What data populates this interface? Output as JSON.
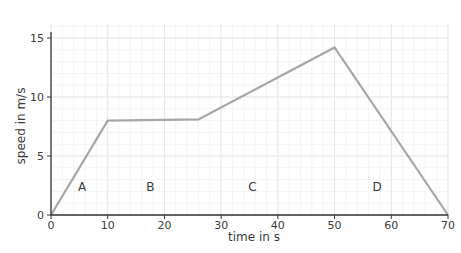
{
  "chart_data": {
    "type": "line",
    "title": "",
    "xlabel": "time in s",
    "ylabel": "speed in m/s",
    "xlim": [
      0,
      70
    ],
    "ylim": [
      0,
      15
    ],
    "xticks": [
      0,
      10,
      20,
      30,
      40,
      50,
      60,
      70
    ],
    "yticks": [
      0,
      5,
      10,
      15
    ],
    "grid": true,
    "legend": null,
    "series": [
      {
        "name": "speed",
        "x": [
          0,
          10,
          26,
          50,
          70
        ],
        "y": [
          0,
          8,
          8.1,
          14.2,
          0
        ],
        "color": "#a6a6a6"
      }
    ],
    "annotations": [
      {
        "text": "A",
        "x": 5.5,
        "y": 2.4
      },
      {
        "text": "B",
        "x": 17.5,
        "y": 2.4
      },
      {
        "text": "C",
        "x": 35.5,
        "y": 2.4
      },
      {
        "text": "D",
        "x": 57.5,
        "y": 2.4
      }
    ]
  },
  "colors": {
    "line": "#a6a6a6",
    "axis": "#333333",
    "grid": "#e6e6e6",
    "text": "#3a3a3a"
  }
}
